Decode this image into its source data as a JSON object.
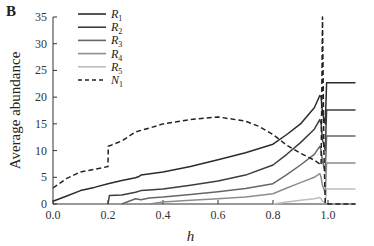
{
  "panel_label": "B",
  "chart_data": {
    "type": "line",
    "title": "",
    "xlabel": "h",
    "ylabel": "Average abundance",
    "xlim": [
      0.0,
      1.1
    ],
    "ylim": [
      0,
      35
    ],
    "xticks": [
      "0.0",
      "0.2",
      "0.4",
      "0.6",
      "0.8",
      "1.0"
    ],
    "yticks": [
      "0",
      "5",
      "10",
      "15",
      "20",
      "25",
      "30",
      "35"
    ],
    "grid": false,
    "legend_position": "upper-left",
    "series": [
      {
        "name": "R1",
        "label_base": "R",
        "label_sub": "1",
        "color": "#2b2b2b",
        "dash": "solid",
        "x": [
          0.0,
          0.05,
          0.1,
          0.15,
          0.2,
          0.25,
          0.3,
          0.31,
          0.32,
          0.4,
          0.5,
          0.6,
          0.7,
          0.8,
          0.85,
          0.9,
          0.95,
          0.97,
          0.975,
          0.98,
          0.99,
          0.995,
          1.1
        ],
        "y": [
          0.5,
          1.5,
          2.5,
          3.1,
          3.8,
          4.4,
          4.9,
          5.1,
          5.4,
          6.0,
          7.0,
          8.3,
          9.6,
          11.2,
          13.0,
          15.0,
          18.0,
          20.3,
          20.0,
          17.0,
          15.0,
          22.7,
          22.7
        ]
      },
      {
        "name": "R2",
        "label_base": "R",
        "label_sub": "2",
        "color": "#3d3d3d",
        "dash": "solid",
        "x": [
          0.2,
          0.205,
          0.25,
          0.3,
          0.32,
          0.35,
          0.4,
          0.5,
          0.6,
          0.7,
          0.8,
          0.85,
          0.9,
          0.95,
          0.97,
          0.975,
          0.98,
          0.99,
          0.995,
          1.1
        ],
        "y": [
          0.0,
          1.6,
          1.7,
          2.2,
          2.5,
          2.6,
          2.8,
          3.5,
          4.3,
          5.4,
          7.3,
          9.3,
          11.5,
          14.0,
          15.8,
          15.0,
          12.0,
          10.0,
          17.6,
          17.6
        ]
      },
      {
        "name": "R3",
        "label_base": "R",
        "label_sub": "3",
        "color": "#666666",
        "dash": "solid",
        "x": [
          0.25,
          0.3,
          0.32,
          0.35,
          0.4,
          0.5,
          0.6,
          0.7,
          0.8,
          0.85,
          0.9,
          0.95,
          0.97,
          0.975,
          0.98,
          0.99,
          0.995,
          1.1
        ],
        "y": [
          0.0,
          1.0,
          0.8,
          1.1,
          1.3,
          1.8,
          2.3,
          2.9,
          3.8,
          5.5,
          7.3,
          9.3,
          10.8,
          10.0,
          8.0,
          6.0,
          12.7,
          12.7
        ]
      },
      {
        "name": "R4",
        "label_base": "R",
        "label_sub": "4",
        "color": "#8c8c8c",
        "dash": "solid",
        "x": [
          0.35,
          0.4,
          0.5,
          0.6,
          0.7,
          0.8,
          0.85,
          0.9,
          0.95,
          0.97,
          0.975,
          0.98,
          0.99,
          0.995,
          1.1
        ],
        "y": [
          0.0,
          0.4,
          0.7,
          1.0,
          1.3,
          1.9,
          3.0,
          4.0,
          5.0,
          5.7,
          5.0,
          3.5,
          2.0,
          7.7,
          7.7
        ]
      },
      {
        "name": "R5",
        "label_base": "R",
        "label_sub": "5",
        "color": "#bdbdbd",
        "dash": "solid",
        "x": [
          0.8,
          0.85,
          0.9,
          0.95,
          0.97,
          0.975,
          0.98,
          0.99,
          0.995,
          1.1
        ],
        "y": [
          0.0,
          0.4,
          0.7,
          1.0,
          1.2,
          1.0,
          0.5,
          0.3,
          2.8,
          2.8
        ]
      },
      {
        "name": "N1",
        "label_base": "N",
        "label_sub": "1",
        "color": "#222222",
        "dash": "dashed",
        "x": [
          0.0,
          0.05,
          0.1,
          0.15,
          0.2,
          0.201,
          0.25,
          0.3,
          0.35,
          0.4,
          0.5,
          0.6,
          0.7,
          0.75,
          0.8,
          0.85,
          0.9,
          0.95,
          0.97,
          0.975,
          0.98,
          0.985,
          0.99,
          1.0,
          1.1
        ],
        "y": [
          3.0,
          4.8,
          6.0,
          6.5,
          7.0,
          10.8,
          11.8,
          13.5,
          14.2,
          15.0,
          15.8,
          16.3,
          15.5,
          14.5,
          13.0,
          11.0,
          9.5,
          8.2,
          7.5,
          7.3,
          35.0,
          10.0,
          0.0,
          0.0,
          0.0
        ]
      }
    ]
  }
}
